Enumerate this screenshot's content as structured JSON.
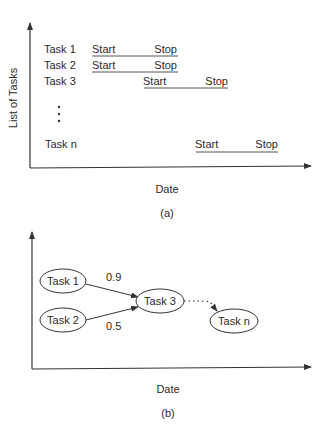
{
  "figure_a": {
    "y_axis_label": "List of Tasks",
    "x_axis_label": "Date",
    "caption": "(a)",
    "rows": [
      {
        "task": "Task 1",
        "start": "Start",
        "stop": "Stop"
      },
      {
        "task": "Task 2",
        "start": "Start",
        "stop": "Stop"
      },
      {
        "task": "Task 3",
        "start": "Start",
        "stop": "Stop"
      },
      {
        "task": "Task n",
        "start": "Start",
        "stop": "Stop"
      }
    ],
    "ellipsis": "⋮"
  },
  "figure_b": {
    "x_axis_label": "Date",
    "caption": "(b)",
    "nodes": [
      {
        "id": "task1",
        "label": "Task 1"
      },
      {
        "id": "task2",
        "label": "Task 2"
      },
      {
        "id": "task3",
        "label": "Task 3"
      },
      {
        "id": "taskn",
        "label": "Task n"
      }
    ],
    "edges": [
      {
        "from": "Task 1",
        "to": "Task 3",
        "weight": "0.9"
      },
      {
        "from": "Task 2",
        "to": "Task 3",
        "weight": "0.5"
      },
      {
        "from": "Task 3",
        "to": "Task n",
        "style": "dotted"
      }
    ]
  }
}
